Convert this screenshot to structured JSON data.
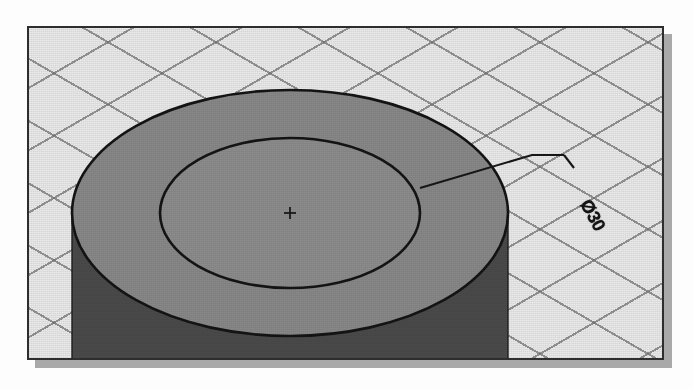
{
  "scene": {
    "kind": "cad-isometric-viewport",
    "background_color": "#e9e9e9",
    "frame_border_color": "#2e2e2e",
    "shadow_color": "#a9a9a9"
  },
  "grid": {
    "name": "isometric-snap-grid",
    "line_color": "#6e6e6e",
    "spacing_px": 54,
    "angles_deg": [
      30,
      150
    ]
  },
  "model": {
    "name": "cylinder-with-counterbore",
    "top_face_color": "#8a8a8a",
    "side_face_color": "#4a4a4a",
    "edge_color": "#1a1a1a",
    "center_mark": "+",
    "outer_circle": {
      "cx": 288,
      "cy": 211,
      "rx": 218,
      "ry": 123
    },
    "inner_circle": {
      "cx": 288,
      "cy": 211,
      "rx": 130,
      "ry": 75
    }
  },
  "annotation": {
    "name": "diameter-dimension",
    "label": "Ø30",
    "symbol": "Ø",
    "value": "30",
    "rotation_deg": 62,
    "leader": {
      "attach_point": [
        418,
        186
      ],
      "elbow_point": [
        562,
        153
      ],
      "shelf_end": [
        530,
        153
      ]
    },
    "color": "#141414"
  }
}
